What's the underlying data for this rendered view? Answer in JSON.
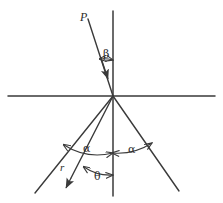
{
  "figure": {
    "canvas": {
      "width": 223,
      "height": 203,
      "background": "#ffffff"
    },
    "stroke_color": "#3a3a3a",
    "labels": {
      "incident_ray": "P",
      "incidence_angle": "β",
      "left_angle": "α",
      "right_angle": "α",
      "refracted_ray": "r",
      "refraction_angle": "θ"
    },
    "geometry": {
      "vertex": {
        "x": 113,
        "y": 96
      },
      "horizontal_axis": {
        "x1": 8,
        "y1": 96,
        "x2": 215,
        "y2": 96
      },
      "vertical_axis": {
        "x1": 113,
        "y1": 11,
        "x2": 113,
        "y2": 196
      },
      "rays": [
        {
          "name": "incident-ray-P",
          "x1": 88,
          "y1": 19,
          "x2": 113,
          "y2": 96,
          "arrow": "mid"
        },
        {
          "name": "lower-left-ray",
          "x1": 113,
          "y1": 96,
          "x2": 35,
          "y2": 193,
          "arrow": "none"
        },
        {
          "name": "lower-right-ray",
          "x1": 113,
          "y1": 96,
          "x2": 179,
          "y2": 191,
          "arrow": "none"
        },
        {
          "name": "refracted-ray-r",
          "x1": 113,
          "y1": 96,
          "x2": 67,
          "y2": 186,
          "arrow": "end"
        }
      ],
      "angle_arcs": [
        {
          "name": "beta-arc",
          "radius": 36,
          "from_deg": 252,
          "to_deg": 288
        },
        {
          "name": "alpha-left-arc",
          "radius": 62,
          "from_deg": 129,
          "to_deg": 90
        },
        {
          "name": "alpha-right-arc",
          "radius": 62,
          "from_deg": 90,
          "to_deg": 55
        },
        {
          "name": "theta-arc",
          "radius": 88,
          "from_deg": 117,
          "to_deg": 90
        }
      ]
    }
  }
}
